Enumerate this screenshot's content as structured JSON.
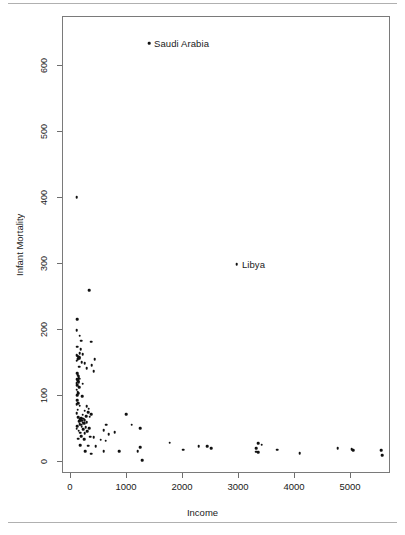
{
  "figure": {
    "rules": {
      "top": true,
      "bottom": true
    }
  },
  "chart_data": {
    "type": "scatter",
    "title": "",
    "xlabel": "Income",
    "ylabel": "Infant Mortality",
    "xlim": [
      -150,
      5800
    ],
    "ylim": [
      -30,
      675
    ],
    "xticks": [
      0,
      1000,
      2000,
      3000,
      4000,
      5000
    ],
    "xticklabels": [
      "0",
      "1000",
      "2000",
      "3000",
      "4000",
      "5000"
    ],
    "yticks": [
      0,
      100,
      200,
      300,
      400,
      500,
      600
    ],
    "yticklabels": [
      "0",
      "100",
      "200",
      "300",
      "400",
      "500",
      "600"
    ],
    "grid": false,
    "legend": null,
    "marker": "filled-circle",
    "marker_color": "#111111",
    "annotations": [
      {
        "label": "Saudi Arabia",
        "x": 1410,
        "y": 633
      },
      {
        "label": "Libya",
        "x": 2980,
        "y": 298
      }
    ],
    "points": [
      [
        1410,
        633
      ],
      [
        2980,
        298
      ],
      [
        120,
        400
      ],
      [
        345,
        259
      ],
      [
        130,
        215
      ],
      [
        120,
        198
      ],
      [
        170,
        190
      ],
      [
        200,
        182
      ],
      [
        380,
        181
      ],
      [
        130,
        173
      ],
      [
        190,
        169
      ],
      [
        175,
        163
      ],
      [
        230,
        162
      ],
      [
        120,
        160
      ],
      [
        140,
        159
      ],
      [
        155,
        158
      ],
      [
        165,
        157
      ],
      [
        175,
        156
      ],
      [
        145,
        155
      ],
      [
        135,
        154
      ],
      [
        440,
        154
      ],
      [
        120,
        152
      ],
      [
        210,
        150
      ],
      [
        265,
        148
      ],
      [
        390,
        145
      ],
      [
        160,
        143
      ],
      [
        300,
        141
      ],
      [
        420,
        136
      ],
      [
        128,
        133
      ],
      [
        138,
        131
      ],
      [
        148,
        129
      ],
      [
        158,
        127
      ],
      [
        168,
        125
      ],
      [
        124,
        124
      ],
      [
        134,
        122
      ],
      [
        144,
        121
      ],
      [
        154,
        119
      ],
      [
        118,
        118
      ],
      [
        230,
        117
      ],
      [
        128,
        115
      ],
      [
        160,
        112
      ],
      [
        122,
        108
      ],
      [
        134,
        105
      ],
      [
        145,
        103
      ],
      [
        128,
        100
      ],
      [
        215,
        98
      ],
      [
        130,
        92
      ],
      [
        150,
        88
      ],
      [
        120,
        86
      ],
      [
        175,
        84
      ],
      [
        300,
        83
      ],
      [
        335,
        79
      ],
      [
        140,
        78
      ],
      [
        265,
        76
      ],
      [
        320,
        74
      ],
      [
        118,
        72
      ],
      [
        380,
        71
      ],
      [
        1000,
        71
      ],
      [
        230,
        70
      ],
      [
        285,
        68
      ],
      [
        355,
        67
      ],
      [
        150,
        66
      ],
      [
        205,
        65
      ],
      [
        240,
        64
      ],
      [
        178,
        63
      ],
      [
        190,
        62
      ],
      [
        260,
        62
      ],
      [
        215,
        61
      ],
      [
        160,
        60
      ],
      [
        300,
        59
      ],
      [
        225,
        58
      ],
      [
        250,
        57
      ],
      [
        172,
        56
      ],
      [
        196,
        55
      ],
      [
        650,
        55
      ],
      [
        1100,
        55
      ],
      [
        128,
        53
      ],
      [
        208,
        52
      ],
      [
        280,
        51
      ],
      [
        340,
        50
      ],
      [
        1250,
        50
      ],
      [
        122,
        49
      ],
      [
        240,
        48
      ],
      [
        600,
        47
      ],
      [
        158,
        46
      ],
      [
        310,
        45
      ],
      [
        800,
        44
      ],
      [
        186,
        43
      ],
      [
        265,
        42
      ],
      [
        690,
        41
      ],
      [
        205,
        38
      ],
      [
        360,
        37
      ],
      [
        420,
        36
      ],
      [
        148,
        34
      ],
      [
        250,
        33
      ],
      [
        545,
        32
      ],
      [
        640,
        31
      ],
      [
        1780,
        28
      ],
      [
        3360,
        27
      ],
      [
        3420,
        25
      ],
      [
        178,
        24
      ],
      [
        320,
        23
      ],
      [
        460,
        22
      ],
      [
        2300,
        22
      ],
      [
        2450,
        22
      ],
      [
        1250,
        21
      ],
      [
        2520,
        19
      ],
      [
        3330,
        19
      ],
      [
        4780,
        19
      ],
      [
        5030,
        18
      ],
      [
        2020,
        17
      ],
      [
        3700,
        17
      ],
      [
        5060,
        16
      ],
      [
        5560,
        16
      ],
      [
        275,
        15
      ],
      [
        600,
        15
      ],
      [
        880,
        15
      ],
      [
        1210,
        15
      ],
      [
        3330,
        14
      ],
      [
        3360,
        13
      ],
      [
        4100,
        12
      ],
      [
        380,
        11
      ],
      [
        5570,
        9
      ],
      [
        1290,
        1
      ]
    ]
  },
  "axis": {
    "x_title": "Income",
    "y_title": "Infant Mortality"
  }
}
